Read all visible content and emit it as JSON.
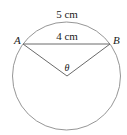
{
  "diagram": {
    "type": "circle-sector",
    "labels": {
      "arc_length": "5 cm",
      "chord_length": "4 cm",
      "point_a": "A",
      "point_b": "B",
      "angle": "θ"
    },
    "colors": {
      "stroke": "#8a8a8a",
      "text": "#222222",
      "background": "#ffffff"
    }
  }
}
